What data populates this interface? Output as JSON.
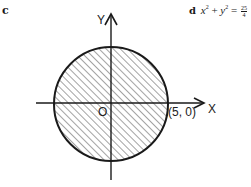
{
  "part_c_label": "c",
  "part_d": {
    "label": "d",
    "equation_lhs_x": "x",
    "equation_sup1": "2",
    "equation_plus": " + ",
    "equation_lhs_y": "y",
    "equation_sup2": "2",
    "equation_eq": " = ",
    "equation_rhs_num": "25",
    "equation_rhs_den": "4"
  },
  "diagram": {
    "x_axis_label": "X",
    "y_axis_label": "Y",
    "origin_label": "O",
    "point_label": "(5, 0)",
    "circle": {
      "center": [
        0,
        0
      ],
      "radius": 5,
      "shaded": "interior",
      "hatch": "diagonal"
    },
    "colors": {
      "stroke": "#1a1a1a",
      "background": "#ffffff"
    }
  }
}
